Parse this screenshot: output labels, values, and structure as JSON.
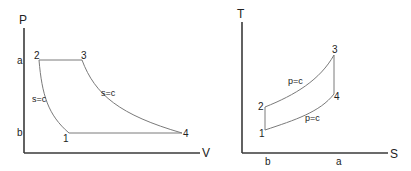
{
  "pv_diagram": {
    "y_axis_label": "P",
    "x_axis_label": "V",
    "y_ticks": {
      "a": "a",
      "b": "b"
    },
    "points": {
      "p1": "1",
      "p2": "2",
      "p3": "3",
      "p4": "4"
    },
    "annotations": {
      "compression": "s=c",
      "expansion": "s=c"
    }
  },
  "ts_diagram": {
    "y_axis_label": "T",
    "x_axis_label": "S",
    "x_ticks": {
      "b": "b",
      "a": "a"
    },
    "points": {
      "p1": "1",
      "p2": "2",
      "p3": "3",
      "p4": "4"
    },
    "annotations": {
      "heat_addition": "p=c",
      "heat_rejection": "p=c"
    }
  }
}
